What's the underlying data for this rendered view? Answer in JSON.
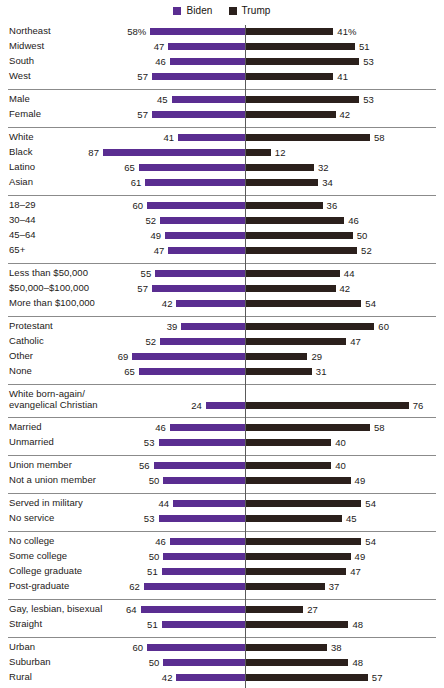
{
  "legend": {
    "entries": [
      {
        "label": "Biden",
        "color": "#5a2d91",
        "icon": "square-swatch-icon"
      },
      {
        "label": "Trump",
        "color": "#2b201c",
        "icon": "square-swatch-icon"
      }
    ]
  },
  "axis": {
    "zero_line_color": "#5a5a5a",
    "rule_color": "#8b8b8b"
  },
  "chart_data": {
    "type": "bar",
    "orientation": "horizontal-diverging",
    "title": "",
    "subtitle": "",
    "xlabel": "",
    "ylabel": "",
    "grid": false,
    "legend_position": "top-center",
    "unit": "percent",
    "series": [
      {
        "name": "Biden",
        "color": "#5a2d91",
        "direction": "left"
      },
      {
        "name": "Trump",
        "color": "#2b201c",
        "direction": "right"
      }
    ],
    "groups": [
      {
        "name": "Region",
        "rows": [
          {
            "category": "Northeast",
            "biden": 58,
            "trump": 41,
            "biden_label": "58%",
            "trump_label": "41%"
          },
          {
            "category": "Midwest",
            "biden": 47,
            "trump": 51,
            "biden_label": "47",
            "trump_label": "51"
          },
          {
            "category": "South",
            "biden": 46,
            "trump": 53,
            "biden_label": "46",
            "trump_label": "53"
          },
          {
            "category": "West",
            "biden": 57,
            "trump": 41,
            "biden_label": "57",
            "trump_label": "41"
          }
        ]
      },
      {
        "name": "Gender",
        "rows": [
          {
            "category": "Male",
            "biden": 45,
            "trump": 53,
            "biden_label": "45",
            "trump_label": "53"
          },
          {
            "category": "Female",
            "biden": 57,
            "trump": 42,
            "biden_label": "57",
            "trump_label": "42"
          }
        ]
      },
      {
        "name": "Race and ethnicity",
        "rows": [
          {
            "category": "White",
            "biden": 41,
            "trump": 58,
            "biden_label": "41",
            "trump_label": "58"
          },
          {
            "category": "Black",
            "biden": 87,
            "trump": 12,
            "biden_label": "87",
            "trump_label": "12"
          },
          {
            "category": "Latino",
            "biden": 65,
            "trump": 32,
            "biden_label": "65",
            "trump_label": "32"
          },
          {
            "category": "Asian",
            "biden": 61,
            "trump": 34,
            "biden_label": "61",
            "trump_label": "34"
          }
        ]
      },
      {
        "name": "Age",
        "rows": [
          {
            "category": "18–29",
            "biden": 60,
            "trump": 36,
            "biden_label": "60",
            "trump_label": "36"
          },
          {
            "category": "30–44",
            "biden": 52,
            "trump": 46,
            "biden_label": "52",
            "trump_label": "46"
          },
          {
            "category": "45–64",
            "biden": 49,
            "trump": 50,
            "biden_label": "49",
            "trump_label": "50"
          },
          {
            "category": "65+",
            "biden": 47,
            "trump": 52,
            "biden_label": "47",
            "trump_label": "52"
          }
        ]
      },
      {
        "name": "Household income",
        "rows": [
          {
            "category": "Less than $50,000",
            "biden": 55,
            "trump": 44,
            "biden_label": "55",
            "trump_label": "44"
          },
          {
            "category": "$50,000–$100,000",
            "biden": 57,
            "trump": 42,
            "biden_label": "57",
            "trump_label": "42"
          },
          {
            "category": "More than $100,000",
            "biden": 42,
            "trump": 54,
            "biden_label": "42",
            "trump_label": "54"
          }
        ]
      },
      {
        "name": "Religion",
        "rows": [
          {
            "category": "Protestant",
            "biden": 39,
            "trump": 60,
            "biden_label": "39",
            "trump_label": "60"
          },
          {
            "category": "Catholic",
            "biden": 52,
            "trump": 47,
            "biden_label": "52",
            "trump_label": "47"
          },
          {
            "category": "Other",
            "biden": 69,
            "trump": 29,
            "biden_label": "69",
            "trump_label": "29"
          },
          {
            "category": "None",
            "biden": 65,
            "trump": 31,
            "biden_label": "65",
            "trump_label": "31"
          }
        ]
      },
      {
        "name": "Born-again",
        "rows": [
          {
            "category": "White born-again/\nevangelical Christian",
            "biden": 24,
            "trump": 76,
            "biden_label": "24",
            "trump_label": "76",
            "two_line": true
          }
        ]
      },
      {
        "name": "Marital status",
        "rows": [
          {
            "category": "Married",
            "biden": 46,
            "trump": 58,
            "biden_label": "46",
            "trump_label": "58"
          },
          {
            "category": "Unmarried",
            "biden": 53,
            "trump": 40,
            "biden_label": "53",
            "trump_label": "40"
          }
        ]
      },
      {
        "name": "Union household",
        "rows": [
          {
            "category": "Union member",
            "biden": 56,
            "trump": 40,
            "biden_label": "56",
            "trump_label": "40"
          },
          {
            "category": "Not a union member",
            "biden": 50,
            "trump": 49,
            "biden_label": "50",
            "trump_label": "49"
          }
        ]
      },
      {
        "name": "Military service",
        "rows": [
          {
            "category": "Served in military",
            "biden": 44,
            "trump": 54,
            "biden_label": "44",
            "trump_label": "54"
          },
          {
            "category": "No service",
            "biden": 53,
            "trump": 45,
            "biden_label": "53",
            "trump_label": "45"
          }
        ]
      },
      {
        "name": "Education",
        "rows": [
          {
            "category": "No college",
            "biden": 46,
            "trump": 54,
            "biden_label": "46",
            "trump_label": "54"
          },
          {
            "category": "Some college",
            "biden": 50,
            "trump": 49,
            "biden_label": "50",
            "trump_label": "49"
          },
          {
            "category": "College graduate",
            "biden": 51,
            "trump": 47,
            "biden_label": "51",
            "trump_label": "47"
          },
          {
            "category": "Post-graduate",
            "biden": 62,
            "trump": 37,
            "biden_label": "62",
            "trump_label": "37"
          }
        ]
      },
      {
        "name": "Sexual orientation",
        "rows": [
          {
            "category": "Gay, lesbian, bisexual",
            "biden": 64,
            "trump": 27,
            "biden_label": "64",
            "trump_label": "27"
          },
          {
            "category": "Straight",
            "biden": 51,
            "trump": 48,
            "biden_label": "51",
            "trump_label": "48"
          }
        ]
      },
      {
        "name": "Community type",
        "rows": [
          {
            "category": "Urban",
            "biden": 60,
            "trump": 38,
            "biden_label": "60",
            "trump_label": "38"
          },
          {
            "category": "Suburban",
            "biden": 50,
            "trump": 48,
            "biden_label": "50",
            "trump_label": "48"
          },
          {
            "category": "Rural",
            "biden": 42,
            "trump": 57,
            "biden_label": "42",
            "trump_label": "57"
          }
        ]
      }
    ]
  }
}
